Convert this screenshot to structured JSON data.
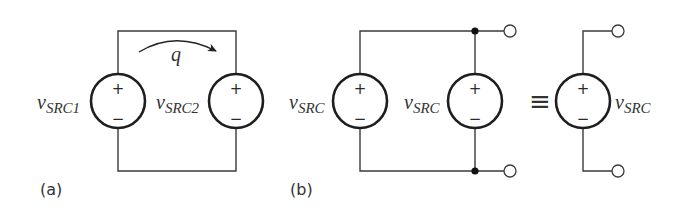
{
  "figure": {
    "part_a": {
      "label": "(a)",
      "source_1": {
        "symbol": "v",
        "subscript": "SRC1",
        "plus": "+",
        "minus": "−"
      },
      "source_2": {
        "symbol": "v",
        "subscript": "SRC2",
        "plus": "+",
        "minus": "−"
      },
      "charge_label": "q"
    },
    "part_b": {
      "label": "(b)",
      "source_left": {
        "symbol": "v",
        "subscript": "SRC",
        "plus": "+",
        "minus": "−"
      },
      "source_middle": {
        "symbol": "v",
        "subscript": "SRC",
        "plus": "+",
        "minus": "−"
      },
      "equivalence_symbol": "≡",
      "source_equivalent": {
        "symbol": "v",
        "subscript": "SRC",
        "plus": "+",
        "minus": "−"
      }
    }
  }
}
